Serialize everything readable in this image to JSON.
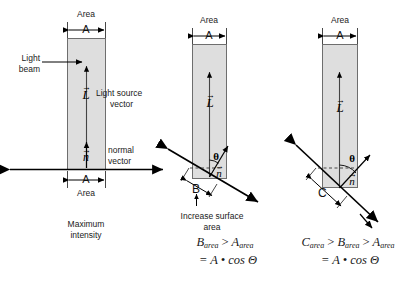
{
  "figure": {
    "type": "physics-diagram",
    "topic": "Light incidence angle and surface area / Lambert cosine law",
    "panels": [
      {
        "id": "panel-1",
        "area_top_label": "Area",
        "dim_letter_top": "A",
        "dim_letter_bottom": "A",
        "area_bottom_label": "Area",
        "light_beam_label": "Light\nbeam",
        "light_beam_line1": "Light",
        "light_beam_line2": "beam",
        "light_source_vector_line1": "Light source",
        "light_source_vector_line2": "vector",
        "normal_vector_line1": "normal",
        "normal_vector_line2": "vector",
        "vector_L": "L",
        "vector_n": "n",
        "caption_line1": "Maximum",
        "caption_line2": "intensity"
      },
      {
        "id": "panel-2",
        "area_top_label": "Area",
        "dim_letter_top": "A",
        "dim_letter_surface": "B",
        "vector_L": "L",
        "vector_n": "n",
        "theta": "θ",
        "caption_line1": "Increase surface",
        "caption_line2": "area",
        "formula_line1_lhs": "B",
        "formula_line1_lhs_sub": "area",
        "formula_line1_rel": ">",
        "formula_line1_rhs": "A",
        "formula_line1_rhs_sub": "area",
        "formula_line2": "= A • cos Θ"
      },
      {
        "id": "panel-3",
        "area_top_label": "Area",
        "dim_letter_top": "A",
        "dim_letter_surface": "C",
        "vector_L": "L",
        "vector_n": "n",
        "theta": "θ",
        "formula_line1_a": "C",
        "formula_line1_a_sub": "area",
        "formula_line1_rel1": ">",
        "formula_line1_b": "B",
        "formula_line1_b_sub": "area",
        "formula_line1_rel2": ">",
        "formula_line1_c": "A",
        "formula_line1_c_sub": "area",
        "formula_line2": "= A • cos Θ"
      }
    ],
    "colors": {
      "background": "#ffffff",
      "beam_fill": "#dedede",
      "beam_stroke": "#6e6e6e",
      "ink": "#1a1a1a",
      "line": "#000000"
    }
  }
}
